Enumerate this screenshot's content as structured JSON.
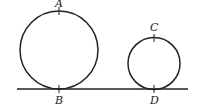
{
  "diagram": {
    "ground_line": {
      "x1": 17,
      "x2": 188,
      "y": 89
    },
    "circles": [
      {
        "name": "large",
        "cx": 59,
        "cy": 50,
        "r": 39,
        "top_label": "A",
        "bottom_label": "B"
      },
      {
        "name": "small",
        "cx": 154,
        "cy": 63.5,
        "r": 26,
        "top_label": "C",
        "bottom_label": "D"
      }
    ],
    "labels": {
      "A": "A",
      "B": "B",
      "C": "C",
      "D": "D"
    },
    "stroke_color": "#222222"
  }
}
